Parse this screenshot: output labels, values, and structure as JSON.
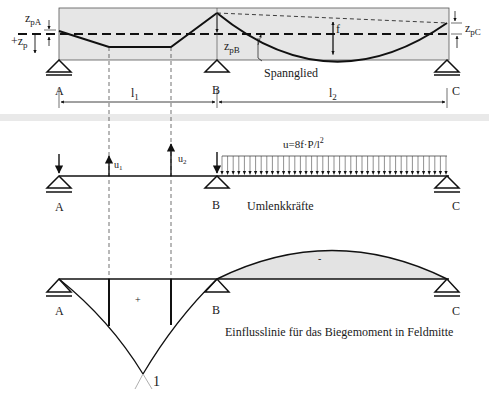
{
  "figure": {
    "section1": {
      "title": "Spannglied-Verlauf",
      "labels": {
        "zpA": "z",
        "zpA_sub": "pA",
        "zp": "+z",
        "zp_sub": "p",
        "zpB": "z",
        "zpB_sub": "pB",
        "zpC": "z",
        "zpC_sub": "pC",
        "f": "f",
        "tendon": "Spannglied",
        "support_A": "A",
        "support_B": "B",
        "support_C": "C",
        "span1": "l",
        "span1_sub": "1",
        "span2": "l",
        "span2_sub": "2"
      }
    },
    "section2": {
      "labels": {
        "u1": "u",
        "u1_sub": "1",
        "u2": "u",
        "u2_sub": "2",
        "formula": "u=8f·P/l",
        "formula_sup": "2",
        "support_A": "A",
        "support_B": "B",
        "support_C": "C",
        "caption": "Umlenkkräfte"
      }
    },
    "section3": {
      "labels": {
        "plus": "+",
        "minus": "-",
        "support_A": "A",
        "support_B": "B",
        "support_C": "C",
        "unit": "1",
        "caption": "Einflusslinie für das Biegemoment in Feldmitte"
      }
    },
    "colors": {
      "beam_fill": "#e6e6e6",
      "influence_fill": "#e3e3e3",
      "separator": "#e9e9e9",
      "line": "#111111"
    }
  }
}
